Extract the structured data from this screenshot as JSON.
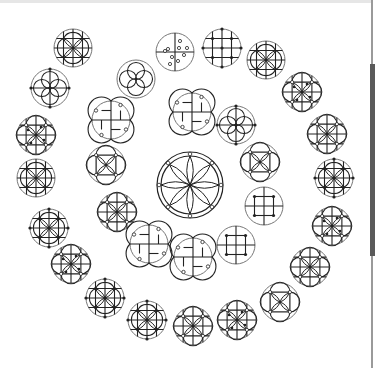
{
  "figure": {
    "stroke_color": "#222222",
    "outer_circle_color": "#777777",
    "background": "#ffffff"
  },
  "center_emblem": {
    "x": 190,
    "y": 185,
    "r": 33,
    "type": "rosette8"
  },
  "inner_ring": [
    {
      "x": 136,
      "y": 79,
      "type": "quatrefoil"
    },
    {
      "x": 175,
      "y": 52,
      "type": "dots-cross"
    },
    {
      "x": 222,
      "y": 48,
      "type": "grid-dots"
    },
    {
      "x": 192,
      "y": 112,
      "type": "swirl"
    },
    {
      "x": 236,
      "y": 125,
      "type": "quatrefoil-dots"
    },
    {
      "x": 111,
      "y": 120,
      "type": "swirl"
    },
    {
      "x": 260,
      "y": 162,
      "type": "square-knot"
    },
    {
      "x": 106,
      "y": 165,
      "type": "square-knot"
    },
    {
      "x": 264,
      "y": 206,
      "type": "grid-square"
    },
    {
      "x": 117,
      "y": 212,
      "type": "knot-petal"
    },
    {
      "x": 236,
      "y": 245,
      "type": "grid-square"
    },
    {
      "x": 149,
      "y": 244,
      "type": "swirl"
    },
    {
      "x": 193,
      "y": 257,
      "type": "swirl"
    }
  ],
  "outer_ring": [
    {
      "x": 73,
      "y": 48,
      "type": "petal-grid"
    },
    {
      "x": 266,
      "y": 60,
      "type": "petal-grid"
    },
    {
      "x": 50,
      "y": 88,
      "type": "quatrefoil-dots"
    },
    {
      "x": 302,
      "y": 92,
      "type": "knot-dense"
    },
    {
      "x": 36,
      "y": 135,
      "type": "knot-dense"
    },
    {
      "x": 327,
      "y": 134,
      "type": "knot-petal"
    },
    {
      "x": 36,
      "y": 178,
      "type": "petal-grid"
    },
    {
      "x": 334,
      "y": 178,
      "type": "petal-grid-dots"
    },
    {
      "x": 49,
      "y": 228,
      "type": "petal-grid-dots"
    },
    {
      "x": 332,
      "y": 226,
      "type": "knot-dense"
    },
    {
      "x": 71,
      "y": 264,
      "type": "knot-dense"
    },
    {
      "x": 310,
      "y": 267,
      "type": "knot-petal"
    },
    {
      "x": 105,
      "y": 298,
      "type": "petal-grid-dots"
    },
    {
      "x": 280,
      "y": 302,
      "type": "square-knot"
    },
    {
      "x": 147,
      "y": 320,
      "type": "petal-grid-dots"
    },
    {
      "x": 237,
      "y": 320,
      "type": "knot-dense"
    },
    {
      "x": 193,
      "y": 326,
      "type": "knot-petal"
    }
  ],
  "emblem_radius": 19,
  "scrollbar": {
    "thumb_top": 64,
    "thumb_height": 192
  }
}
